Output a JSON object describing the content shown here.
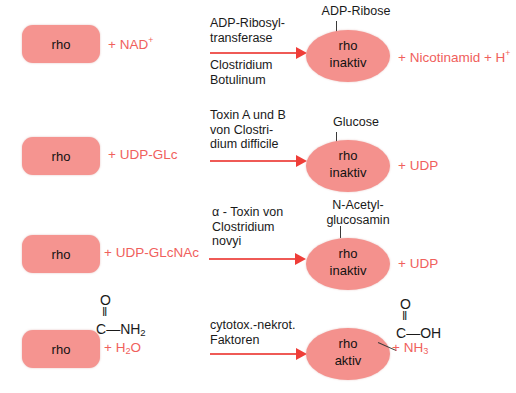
{
  "figure": {
    "accent_red": "#f0605c",
    "box_fill": "#f59490",
    "ellipse_fill": "#f4918d",
    "arrow_color": "#ef3d38",
    "text_color": "#1a1a1a",
    "background": "#ffffff"
  },
  "rows": [
    {
      "substrate_box_label": "rho",
      "substrate_text": "+ NAD",
      "substrate_sup": "+",
      "enzyme_lines": [
        "ADP-Ribosyl-",
        "transferase"
      ],
      "organism_lines": [
        "Clostridium",
        "Botulinum"
      ],
      "modification": [
        "ADP-Ribose"
      ],
      "product_line1": "rho",
      "product_line2": "inaktiv",
      "released": "+ Nicotinamid + H",
      "released_sup": "+"
    },
    {
      "substrate_box_label": "rho",
      "substrate_text": "+ UDP-GLc",
      "substrate_sup": "",
      "enzyme_lines": [
        "Toxin A und B",
        "von Clostri-",
        "dium difficile"
      ],
      "organism_lines": [],
      "modification": [
        "Glucose"
      ],
      "product_line1": "rho",
      "product_line2": "inaktiv",
      "released": "+ UDP",
      "released_sup": ""
    },
    {
      "substrate_box_label": "rho",
      "substrate_text": "+ UDP-GLcNAc",
      "substrate_sup": "",
      "enzyme_lines": [
        "α - Toxin von",
        "Clostridium",
        "novyi"
      ],
      "organism_lines": [],
      "modification": [
        "N-Acetyl-",
        "glucosamin"
      ],
      "product_line1": "rho",
      "product_line2": "inaktiv",
      "released": "+ UDP",
      "released_sup": ""
    },
    {
      "substrate_box_label": "rho",
      "substrate_text": "+ H",
      "substrate_sub": "2",
      "substrate_text2": "O",
      "enzyme_lines": [
        "cytotox.-nekrot.",
        "Faktoren"
      ],
      "organism_lines": [],
      "modification": [],
      "product_line1": "rho",
      "product_line2": "aktiv",
      "released": "+ NH",
      "released_sub": "3"
    }
  ],
  "chem_left": {
    "oxygen": "O",
    "double_bond": "‖",
    "carbon": "C",
    "bond": "—",
    "group": "NH",
    "group_sub": "2"
  },
  "chem_right": {
    "oxygen": "O",
    "double_bond": "‖",
    "carbon": "C",
    "bond": "—",
    "group": "OH",
    "group_sub": ""
  }
}
